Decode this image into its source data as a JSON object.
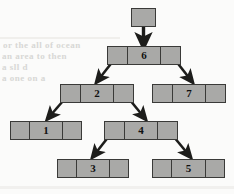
{
  "figure": {
    "type": "binary-tree-linked-structure",
    "background_color": "#fbfbfa",
    "node_fill_color": "#a9a9a7",
    "node_border_color": "#3a3a38",
    "arrow_color": "#1d1d1b"
  },
  "root_pointer": {
    "label": "",
    "x": 131,
    "y": 8,
    "width": 25,
    "height": 19
  },
  "nodes": [
    {
      "id": "n6",
      "value": "6",
      "x": 107,
      "y": 46,
      "width": 74,
      "left_child": "n2",
      "right_child": "n7"
    },
    {
      "id": "n2",
      "value": "2",
      "x": 60,
      "y": 84,
      "width": 74,
      "left_child": "n1",
      "right_child": "n4"
    },
    {
      "id": "n7",
      "value": "7",
      "x": 152,
      "y": 84,
      "width": 74,
      "left_child": null,
      "right_child": null
    },
    {
      "id": "n1",
      "value": "1",
      "x": 10,
      "y": 121,
      "width": 72,
      "left_child": null,
      "right_child": null
    },
    {
      "id": "n4",
      "value": "4",
      "x": 104,
      "y": 121,
      "width": 74,
      "left_child": "n3",
      "right_child": "n5"
    },
    {
      "id": "n3",
      "value": "3",
      "x": 57,
      "y": 159,
      "width": 72,
      "left_child": null,
      "right_child": null
    },
    {
      "id": "n5",
      "value": "5",
      "x": 152,
      "y": 159,
      "width": 73,
      "left_child": null,
      "right_child": null
    }
  ],
  "edges": [
    {
      "from": "root_pointer",
      "to": "n6",
      "kind": "vertical"
    },
    {
      "from": "n6",
      "to": "n2",
      "kind": "left"
    },
    {
      "from": "n6",
      "to": "n7",
      "kind": "right"
    },
    {
      "from": "n2",
      "to": "n1",
      "kind": "left"
    },
    {
      "from": "n2",
      "to": "n4",
      "kind": "right"
    },
    {
      "from": "n4",
      "to": "n3",
      "kind": "left"
    },
    {
      "from": "n4",
      "to": "n5",
      "kind": "right"
    }
  ],
  "background_ghost_text": [
    {
      "text": "or the all of ocean",
      "x": 3,
      "y": 41
    },
    {
      "text": "an area to then",
      "x": 2,
      "y": 53
    },
    {
      "text": "a sll d",
      "x": 2,
      "y": 64
    },
    {
      "text": "a one on a",
      "x": 2,
      "y": 75
    }
  ]
}
